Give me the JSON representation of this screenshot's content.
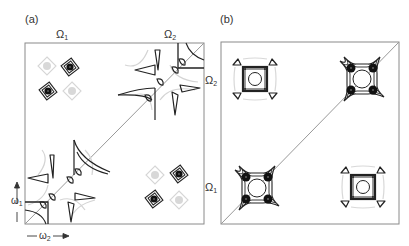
{
  "figure": {
    "panel_a": {
      "label": "(a)",
      "top_labels": [
        {
          "text": "Ω",
          "sub": "1"
        },
        {
          "text": "Ω",
          "sub": "2"
        }
      ],
      "axis_y": {
        "text": "ω",
        "sub": "1"
      },
      "axis_x": {
        "text": "ω",
        "sub": "2"
      }
    },
    "panel_b": {
      "label": "(b)",
      "left_labels": [
        {
          "text": "Ω",
          "sub": "2"
        },
        {
          "text": "Ω",
          "sub": "1"
        }
      ]
    },
    "colors": {
      "frame": "#8a8a8a",
      "diagonal": "#8a8a8a",
      "contour_dark": "#222222",
      "contour_light": "#cfcfcf",
      "peak_fill": "#111111",
      "peak_light_fill": "#d8d8d8"
    }
  }
}
